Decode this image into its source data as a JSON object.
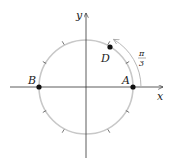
{
  "diagram": {
    "axes": {
      "x_label": "x",
      "y_label": "y"
    },
    "points": [
      {
        "id": "A",
        "label": "A",
        "angle_deg": 0
      },
      {
        "id": "B",
        "label": "B",
        "angle_deg": 180
      },
      {
        "id": "D",
        "label": "D",
        "angle_deg": 60
      }
    ],
    "arc_label": {
      "numerator": "π",
      "denominator": "3"
    },
    "tick_count": 12,
    "colors": {
      "circle": "#c8c8c8",
      "axis": "#333333",
      "point": "#111111",
      "arc": "#b0b0b0"
    }
  }
}
